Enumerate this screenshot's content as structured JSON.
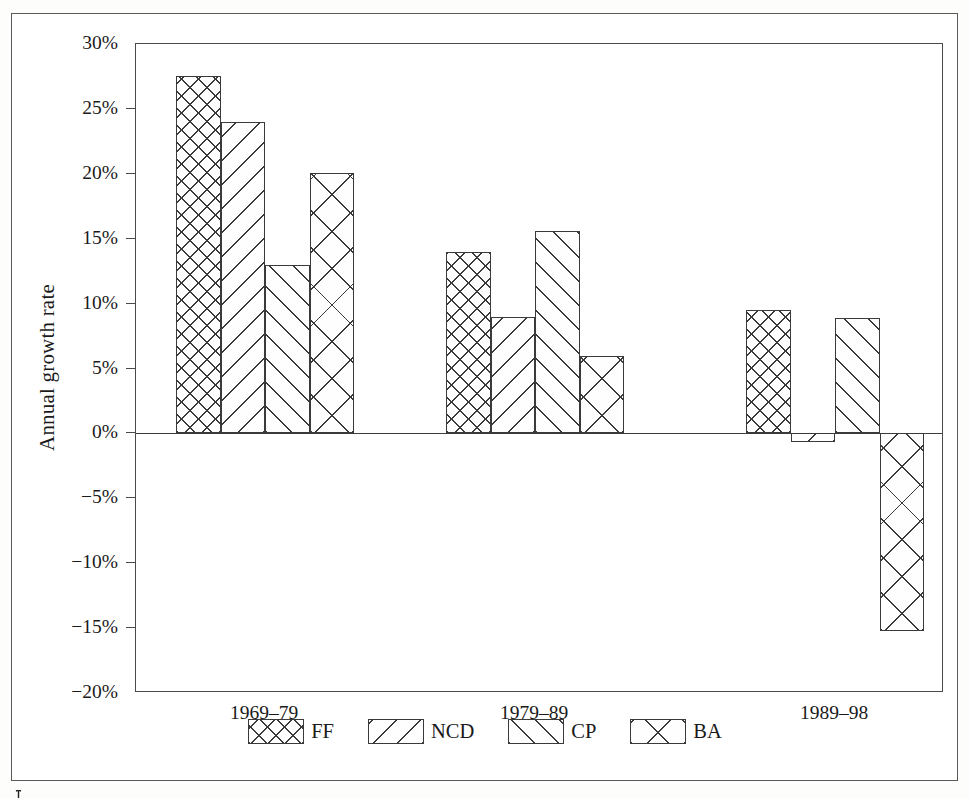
{
  "chart_data": {
    "type": "bar",
    "title": "",
    "xlabel": "",
    "ylabel": "Annual growth rate",
    "categories": [
      "1969–79",
      "1979–89",
      "1989–98"
    ],
    "ylim": [
      -20,
      30
    ],
    "ytick_step": 5,
    "ytick_labels": [
      "30%",
      "25%",
      "20%",
      "15%",
      "10%",
      "5%",
      "0%",
      "−5%",
      "−10%",
      "−15%",
      "−20%"
    ],
    "ytick_values": [
      30,
      25,
      20,
      15,
      10,
      5,
      0,
      -5,
      -10,
      -15,
      -20
    ],
    "grid": false,
    "legend_position": "bottom",
    "series": [
      {
        "name": "FF",
        "pattern": "cross-hatch-fine",
        "values": [
          27.5,
          14.0,
          9.5
        ]
      },
      {
        "name": "NCD",
        "pattern": "diagonal-backslash",
        "values": [
          24.0,
          9.0,
          -0.7
        ]
      },
      {
        "name": "CP",
        "pattern": "diagonal-forwardslash",
        "values": [
          13.0,
          15.6,
          8.9
        ]
      },
      {
        "name": "BA",
        "pattern": "cross-hatch-wide",
        "values": [
          20.1,
          6.0,
          -15.2
        ]
      }
    ]
  },
  "axis": {
    "y_title": "Annual growth rate"
  },
  "legend": {
    "entries": [
      {
        "label": "FF"
      },
      {
        "label": "NCD"
      },
      {
        "label": "CP"
      },
      {
        "label": "BA"
      }
    ]
  },
  "colors": {
    "hatch": "#3a3a3a",
    "frame": "#5a5a5a",
    "axis": "#4a4a4a",
    "background": "#ffffff"
  }
}
